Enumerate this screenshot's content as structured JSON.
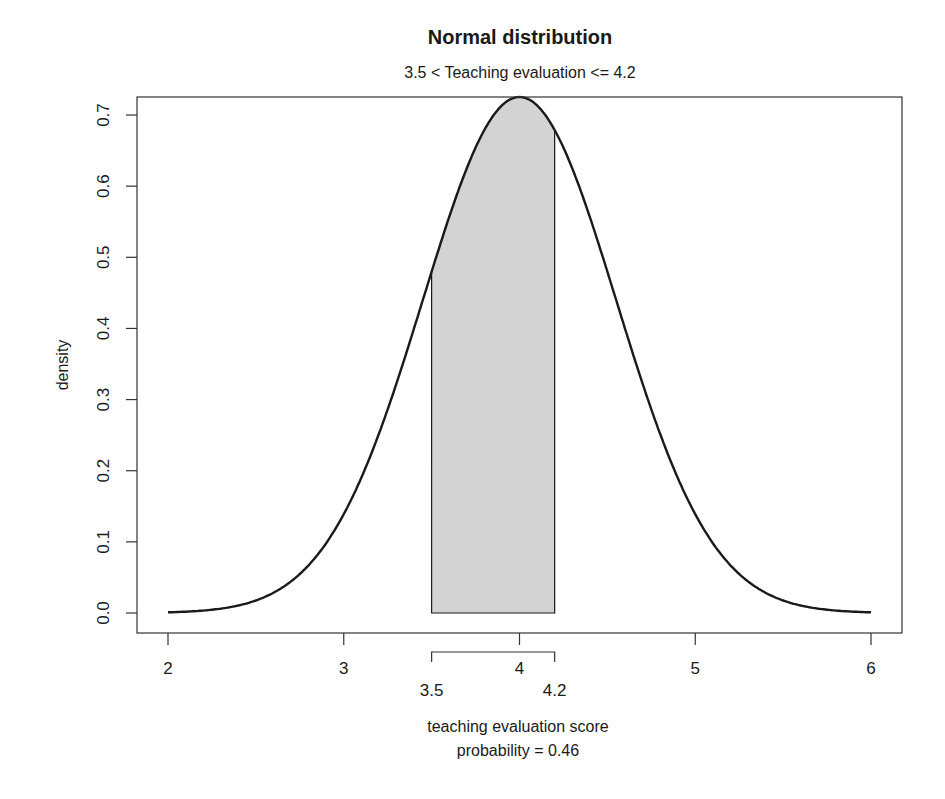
{
  "chart_data": {
    "type": "area",
    "title": "Normal distribution",
    "subtitle": "3.5 < Teaching evaluation <= 4.2",
    "xlabel": "teaching evaluation score",
    "xlabel_line2": "probability = 0.46",
    "ylabel": "density",
    "xlim": [
      1.9,
      6.2
    ],
    "ylim": [
      -0.03,
      0.74
    ],
    "x_ticks": [
      2,
      3,
      4,
      5,
      6
    ],
    "x_tick_labels": [
      "2",
      "3",
      "4",
      "5",
      "6"
    ],
    "y_ticks": [
      0.0,
      0.1,
      0.2,
      0.3,
      0.4,
      0.5,
      0.6,
      0.7
    ],
    "y_tick_labels": [
      "0.0",
      "0.1",
      "0.2",
      "0.3",
      "0.4",
      "0.5",
      "0.6",
      "0.7"
    ],
    "grid": false,
    "legend": null,
    "distribution": {
      "family": "normal",
      "mean": 4.0,
      "sd": 0.55
    },
    "curve_range": [
      2,
      6
    ],
    "shaded_region": {
      "lower": 3.5,
      "upper": 4.2,
      "lower_label": "3.5",
      "upper_label": "4.2",
      "fill": "#d3d3d3"
    },
    "probability": 0.46,
    "sample_points": {
      "x": [
        2.0,
        2.5,
        3.0,
        3.5,
        4.0,
        4.2,
        4.5,
        5.0,
        5.5,
        6.0
      ],
      "y": [
        0.0,
        0.02,
        0.14,
        0.48,
        0.72,
        0.68,
        0.48,
        0.14,
        0.02,
        0.0
      ]
    }
  },
  "colors": {
    "line": "#1a1a1a",
    "fill": "#d3d3d3",
    "axis": "#333333",
    "background": "#ffffff"
  }
}
